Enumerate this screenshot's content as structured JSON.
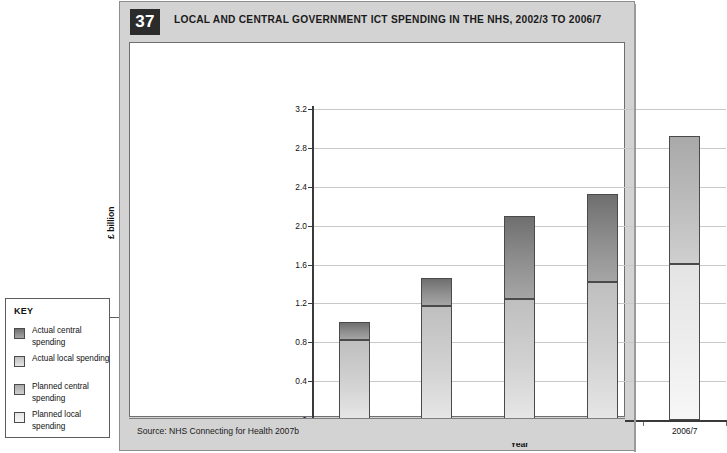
{
  "figure": {
    "number": "37",
    "title": "LOCAL AND CENTRAL GOVERNMENT ICT SPENDING IN THE NHS, 2002/3 TO 2006/7",
    "source": "Source: NHS Connecting for Health 2007b"
  },
  "legend": {
    "title": "KEY",
    "items": [
      {
        "label": "Actual central spending",
        "color": "#8f8f8f"
      },
      {
        "label": "Actual local spending",
        "color": "#d2d2d2"
      },
      {
        "label": "Planned central spending",
        "color": "#bdbdbd"
      },
      {
        "label": "Planned local spending",
        "color": "#f2f2f2"
      }
    ]
  },
  "chart_data": {
    "type": "bar",
    "subtype": "stacked",
    "title": "LOCAL AND CENTRAL GOVERNMENT ICT SPENDING IN THE NHS, 2002/3 TO 2006/7",
    "xlabel": "Year",
    "ylabel": "£ billion",
    "ylim": [
      0,
      3.2
    ],
    "yticks": [
      "0",
      "0.4",
      "0.8",
      "1.2",
      "1.6",
      "2.0",
      "2.4",
      "2.8",
      "3.2"
    ],
    "ytick_values": [
      0,
      0.4,
      0.8,
      1.2,
      1.6,
      2.0,
      2.4,
      2.8,
      3.2
    ],
    "grid": true,
    "legend_position": "outside-left",
    "categories": [
      "2002/3",
      "2003/4",
      "2004/5",
      "2005/6",
      "2006/7"
    ],
    "series": [
      {
        "name": "Actual local spending",
        "values": [
          0.82,
          1.17,
          1.25,
          1.42,
          null
        ]
      },
      {
        "name": "Actual central spending",
        "values": [
          0.19,
          0.29,
          0.85,
          0.91,
          null
        ]
      },
      {
        "name": "Planned local spending",
        "values": [
          null,
          null,
          null,
          null,
          1.61
        ]
      },
      {
        "name": "Planned central spending",
        "values": [
          null,
          null,
          null,
          null,
          1.31
        ]
      }
    ],
    "totals": [
      1.01,
      1.46,
      2.1,
      2.33,
      2.92
    ],
    "bars": [
      {
        "category": "2002/3",
        "lower": 0.82,
        "upper": 1.01,
        "lower_type": "actual-local",
        "upper_type": "actual-central"
      },
      {
        "category": "2003/4",
        "lower": 1.17,
        "upper": 1.46,
        "lower_type": "actual-local",
        "upper_type": "actual-central"
      },
      {
        "category": "2004/5",
        "lower": 1.25,
        "upper": 2.1,
        "lower_type": "actual-local",
        "upper_type": "actual-central"
      },
      {
        "category": "2005/6",
        "lower": 1.42,
        "upper": 2.33,
        "lower_type": "actual-local",
        "upper_type": "actual-central"
      },
      {
        "category": "2006/7",
        "lower": 1.61,
        "upper": 2.92,
        "lower_type": "planned-local",
        "upper_type": "planned-central"
      }
    ]
  }
}
